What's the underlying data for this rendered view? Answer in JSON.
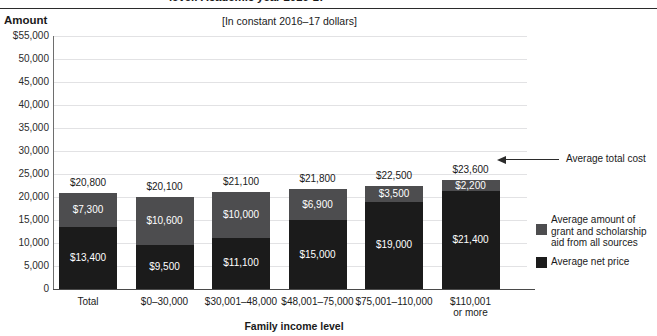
{
  "header": {
    "title": "level: Academic year 2016-17",
    "amount_label": "Amount",
    "subtitle": "[In constant 2016–17 dollars]"
  },
  "chart_data": {
    "type": "bar",
    "title": "level: Academic year 2016-17",
    "subtitle": "[In constant 2016–17 dollars]",
    "xlabel": "Family income level",
    "ylabel": "Amount",
    "ylim": [
      0,
      55000
    ],
    "ytick_step": 5000,
    "grid": true,
    "stacked": true,
    "legend_position": "right",
    "categories": [
      "Total",
      "$0–30,000",
      "$30,001–48,000",
      "$48,001–75,000",
      "$75,001–110,000",
      "$110,001 or more"
    ],
    "category_labels": [
      [
        "Total"
      ],
      [
        "$0–30,000"
      ],
      [
        "$30,001–48,000"
      ],
      [
        "$48,001–75,000"
      ],
      [
        "$75,001–110,000"
      ],
      [
        "$110,001",
        "or more"
      ]
    ],
    "series": [
      {
        "name": "Average net price",
        "color": "#1b1b1b",
        "values": [
          13400,
          9500,
          11100,
          15000,
          19000,
          21400
        ],
        "labels": [
          "$13,400",
          "$9,500",
          "$11,100",
          "$15,000",
          "$19,000",
          "$21,400"
        ]
      },
      {
        "name": "Average amount of grant and scholarship aid from all sources",
        "color": "#4d4d4f",
        "values": [
          7300,
          10600,
          10000,
          6900,
          3500,
          2200
        ],
        "labels": [
          "$7,300",
          "$10,600",
          "$10,000",
          "$6,900",
          "$3,500",
          "$2,200"
        ]
      }
    ],
    "totals": [
      20800,
      20100,
      21100,
      21800,
      22500,
      23600
    ],
    "total_labels": [
      "$20,800",
      "$20,100",
      "$21,100",
      "$21,800",
      "$22,500",
      "$23,600"
    ],
    "ytick_labels": [
      "$55,000",
      "50,000",
      "45,000",
      "40,000",
      "35,000",
      "30,000",
      "25,000",
      "20,000",
      "15,000",
      "10,000",
      "5,000",
      "0"
    ],
    "ytick_values": [
      55000,
      50000,
      45000,
      40000,
      35000,
      30000,
      25000,
      20000,
      15000,
      10000,
      5000,
      0
    ],
    "annotations": [
      {
        "text": "Average total cost",
        "points_to": "$23,600"
      }
    ]
  },
  "legend": {
    "total_cost": "Average total cost",
    "grant_line1": "Average amount of",
    "grant_line2": "grant and scholarship",
    "grant_line3": "aid from all sources",
    "net_price": "Average net price"
  },
  "colors": {
    "grant": "#4d4d4f",
    "net": "#1b1b1b",
    "gridline": "#e2e2e4",
    "axis": "#4a4a4a"
  },
  "x_axis_title": "Family income level"
}
